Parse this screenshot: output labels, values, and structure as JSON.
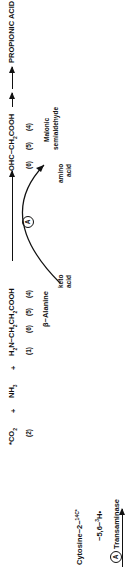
{
  "diagram": {
    "start_compound": {
      "name": "Cytosine−2−",
      "isotope_label": "14",
      "isotope_suffix": "C*",
      "tritium_line_prefix": "−5,6−",
      "tritium_isotope": "3",
      "tritium_suffix": "H•"
    },
    "products": {
      "co2": {
        "formula": "*CO",
        "sub": "2",
        "position": "(2)"
      },
      "plus1": "+",
      "nh3": {
        "formula": "NH",
        "sub": "3"
      },
      "plus2": "+",
      "beta_alanine": {
        "formula_parts": [
          "H",
          "2",
          "N−CH",
          "2",
          "CH",
          "2",
          "COOH"
        ],
        "positions": [
          "(1)",
          "(6)",
          "(5)",
          "(4)"
        ],
        "name": "β−Alanine"
      },
      "malonic_semialdehyde": {
        "formula_parts": [
          "OHC−CH",
          "2",
          "COOH"
        ],
        "positions": [
          "(6)",
          "(5)",
          "(4)"
        ],
        "name_line1": "Malonic",
        "name_line2": "semialdehyde"
      },
      "end_product": "PROPIONIC ACID"
    },
    "enzyme_marker": "A",
    "cofactors": {
      "in_line1": "keto",
      "in_line2": "acid",
      "out_line1": "amino",
      "out_line2": "acid"
    },
    "legend": {
      "marker": "A",
      "label": "Transaminase"
    }
  }
}
